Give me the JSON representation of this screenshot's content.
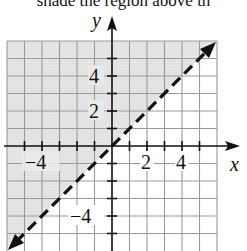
{
  "caption": "shade the region above th",
  "graph": {
    "x_axis_label": "x",
    "y_axis_label": "y",
    "x_tick_labels": [
      "−4",
      "2",
      "4"
    ],
    "y_tick_labels": [
      "4",
      "2",
      "−4"
    ],
    "x_range": [
      -6,
      6
    ],
    "y_range": [
      -6,
      6
    ],
    "grid_step": 1,
    "line": {
      "equation": "y = x",
      "style": "dashed",
      "arrows": "both ends"
    },
    "shaded_region": "above the line (y > x)",
    "shade_color": "#e2e2e2",
    "line_color": "#111111"
  }
}
